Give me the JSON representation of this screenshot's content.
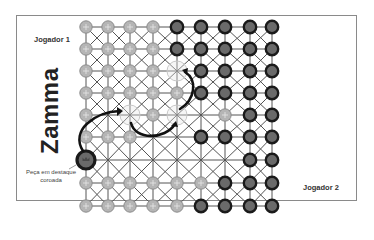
{
  "title": "Zamma",
  "players": {
    "player1_label": "Jogador 1",
    "player2_label": "Jogador 2"
  },
  "callout": {
    "line1": "Peça em destaque",
    "line2": "coroada"
  },
  "colors": {
    "light_piece": "#b5b5b5",
    "dark_piece_fill": "#6a6a6a",
    "dark_piece_ring": "#1a1a1a",
    "grid_line": "#555555",
    "frame": "#8a8a8a",
    "ghost_ring": "#c8c8c8"
  },
  "board": {
    "cols": 9,
    "rows": 9,
    "legend": {
      "L": "Jogador 1 piece (light)",
      "D": "Jogador 2 piece (dark)",
      "G": "highlighted empty destination",
      "C": "crowned piece",
      ".": "empty"
    },
    "grid": [
      [
        "L",
        "L",
        "L",
        "L",
        "D",
        "D",
        "D",
        "D",
        "D"
      ],
      [
        "L",
        "L",
        "L",
        "L",
        "D",
        "D",
        "D",
        "D",
        "D"
      ],
      [
        "L",
        "L",
        "L",
        "L",
        "G",
        "D",
        "D",
        "D",
        "D"
      ],
      [
        "L",
        "L",
        "L",
        "L",
        "L",
        "D",
        "D",
        "D",
        "D"
      ],
      [
        "L",
        ".",
        "G",
        "L",
        "G",
        ".",
        "L",
        "D",
        "D"
      ],
      [
        "L",
        "L",
        "L",
        ".",
        ".",
        "D",
        "D",
        "D",
        "D"
      ],
      [
        "C",
        ".",
        ".",
        ".",
        ".",
        ".",
        ".",
        "D",
        "D"
      ],
      [
        "L",
        "L",
        "L",
        "L",
        "L",
        "L",
        "D",
        "D",
        "D"
      ],
      [
        "L",
        "L",
        "L",
        "L",
        "L",
        "D",
        "D",
        "D",
        "D"
      ]
    ],
    "moves": [
      {
        "from": [
          6,
          0
        ],
        "to": [
          4,
          2
        ],
        "description": "curved arrow from crowned piece"
      },
      {
        "from": [
          4,
          2
        ],
        "to": [
          4,
          4
        ],
        "description": "curved arrow under row"
      },
      {
        "from": [
          4,
          4
        ],
        "to": [
          2,
          4
        ],
        "description": "curved arrow upward"
      }
    ]
  }
}
